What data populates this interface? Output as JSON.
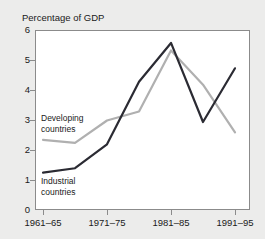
{
  "figure": {
    "faint_header": "",
    "background_color": "#ececeb",
    "plot_background_color": "#ffffff",
    "frame_color": "#8b8b8b"
  },
  "chart_data": {
    "type": "line",
    "title": "",
    "axis_title": "Percentage of GDP",
    "xlabel": "",
    "ylabel": "Percentage of GDP",
    "categories": [
      "1961–65",
      "1966–70",
      "1971–75",
      "1976–80",
      "1981–85",
      "1986–90",
      "1991–95"
    ],
    "tick_labels_shown": [
      "1961–65",
      "1971–75",
      "1981–85",
      "1991–95"
    ],
    "ylim": [
      0,
      6
    ],
    "yticks": [
      0,
      1,
      2,
      3,
      4,
      5,
      6
    ],
    "grid": false,
    "legend_position": "inline-annotations",
    "series": [
      {
        "name": "Developing countries",
        "color": "#b0b0b0",
        "values": [
          2.35,
          2.25,
          3.0,
          3.3,
          5.35,
          4.2,
          2.6
        ]
      },
      {
        "name": "Industrial countries",
        "color": "#2b2b33",
        "values": [
          1.25,
          1.4,
          2.2,
          4.3,
          5.6,
          2.95,
          4.75
        ]
      }
    ],
    "annotations": [
      {
        "text": "Developing countries",
        "series": "Developing countries"
      },
      {
        "text": "Industrial countries",
        "series": "Industrial countries"
      }
    ]
  },
  "axis": {
    "y_tick_labels": [
      "6",
      "5",
      "4",
      "3",
      "2",
      "1",
      "0"
    ],
    "x_tick_labels": [
      "1961–65",
      "1971–75",
      "1981–85",
      "1991–95"
    ]
  },
  "labels": {
    "developing_line1": "Developing",
    "developing_line2": "countries",
    "industrial_line1": "Industrial",
    "industrial_line2": "countries"
  }
}
